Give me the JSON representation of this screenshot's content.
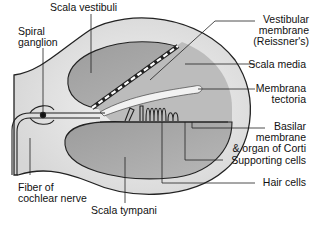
{
  "labels": {
    "scala_vestibuli": "Scala vestibuli",
    "spiral_ganglion": [
      "Spiral",
      "ganglion"
    ],
    "vestibular_membrane": [
      "Vestibular",
      "membrane",
      "(Reissner's)"
    ],
    "scala_media": "Scala media",
    "membrana_tectoria": [
      "Membrana",
      "tectoria"
    ],
    "basilar_membrane": [
      "Basilar",
      "membrane",
      "& organ of Corti"
    ],
    "supporting_cells": "Supporting cells",
    "hair_cells": "Hair cells",
    "fiber_of_cochlear_nerve": [
      "Fiber of",
      "cochlear nerve"
    ],
    "scala_tympani": "Scala tympani"
  },
  "colors": {
    "outer_fill": "#e8e8e8",
    "chamber_fill": "#a9a9a9",
    "media_fill": "#bdbdbd",
    "line": "#222222",
    "tectoria_fill": "#f0f0f0"
  }
}
